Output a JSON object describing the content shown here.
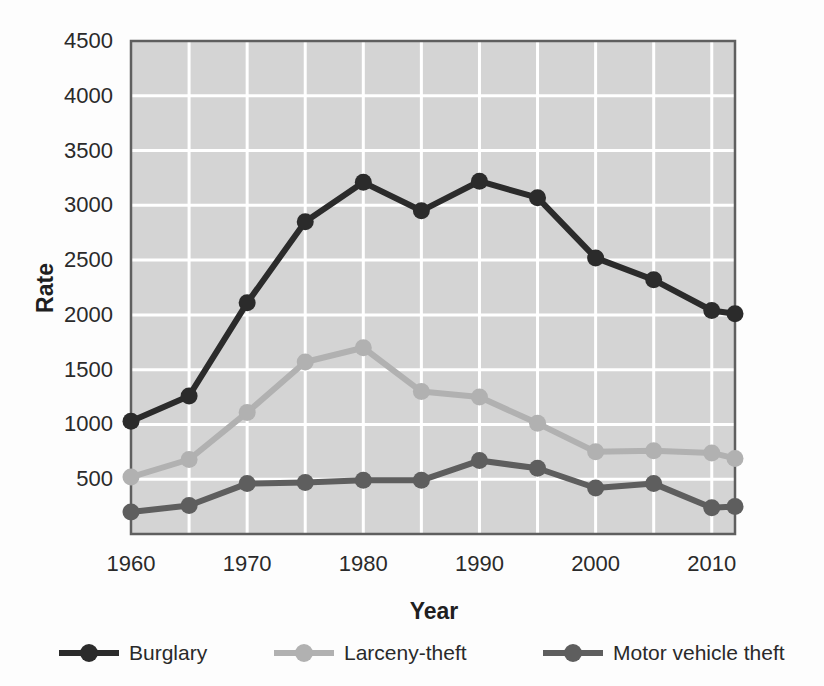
{
  "page": {
    "background": "#fdfdfd",
    "text_color": "#2a2a2a"
  },
  "chart_data": {
    "type": "line",
    "title": "",
    "xlabel": "Year",
    "ylabel": "Rate",
    "x": [
      1960,
      1965,
      1970,
      1975,
      1980,
      1985,
      1990,
      1995,
      2000,
      2005,
      2010,
      2012
    ],
    "series": [
      {
        "name": "Burglary",
        "color": "#2b2b2b",
        "values": [
          1030,
          1260,
          2110,
          2850,
          3210,
          2950,
          3220,
          3070,
          2520,
          2320,
          2040,
          2010
        ]
      },
      {
        "name": "Larceny-theft",
        "color": "#b1b1b1",
        "values": [
          520,
          680,
          1110,
          1570,
          1700,
          1300,
          1250,
          1010,
          750,
          760,
          740,
          690
        ]
      },
      {
        "name": "Motor vehicle theft",
        "color": "#5e5e5e",
        "values": [
          200,
          260,
          460,
          470,
          490,
          490,
          670,
          600,
          420,
          460,
          240,
          250
        ]
      }
    ],
    "xlim": [
      1960,
      2012
    ],
    "ylim": [
      0,
      4500
    ],
    "x_ticks": [
      1960,
      1970,
      1980,
      1990,
      2000,
      2010
    ],
    "x_tick_labels": [
      "1960",
      "1970",
      "1980",
      "1990",
      "2000",
      "2010"
    ],
    "y_ticks": [
      500,
      1000,
      1500,
      2000,
      2500,
      3000,
      3500,
      4000,
      4500
    ],
    "y_tick_labels": [
      "500",
      "1000",
      "1500",
      "2000",
      "2500",
      "3000",
      "3500",
      "4000",
      "4500"
    ],
    "grid": "on",
    "grid_x_interval_years": 5,
    "grid_y_interval": 500,
    "legend_position": "bottom",
    "styles": {
      "plot_bg": "#d4d4d4",
      "grid_color": "#ffffff",
      "border_color": "#5f5f5f",
      "line_width": 6,
      "marker_radius": 8.5
    }
  }
}
